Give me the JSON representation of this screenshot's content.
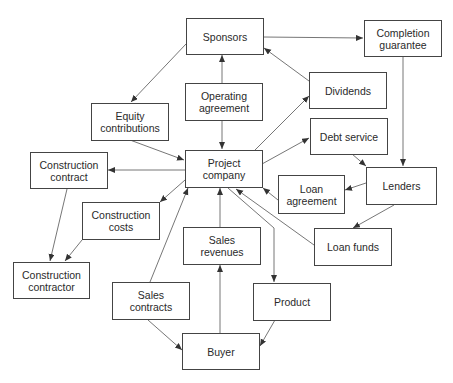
{
  "diagram": {
    "title": "",
    "colors": {
      "stroke": "#444444",
      "text": "#2a2a2a",
      "background": "#ffffff"
    },
    "nodes": {
      "sponsors": {
        "label": "Sponsors"
      },
      "completion_guarantee": {
        "label": "Completion\nguarantee"
      },
      "operating_agreement": {
        "label": "Operating\nagreement"
      },
      "dividends": {
        "label": "Dividends"
      },
      "equity_contributions": {
        "label": "Equity\ncontributions"
      },
      "debt_service": {
        "label": "Debt service"
      },
      "construction_contract": {
        "label": "Construction\ncontract"
      },
      "project_company": {
        "label": "Project\ncompany"
      },
      "lenders": {
        "label": "Lenders"
      },
      "loan_agreement": {
        "label": "Loan\nagreement"
      },
      "construction_costs": {
        "label": "Construction\ncosts"
      },
      "loan_funds": {
        "label": "Loan funds"
      },
      "sales_revenues": {
        "label": "Sales\nrevenues"
      },
      "construction_contractor": {
        "label": "Construction\ncontractor"
      },
      "sales_contracts": {
        "label": "Sales\ncontracts"
      },
      "product": {
        "label": "Product"
      },
      "buyer": {
        "label": "Buyer"
      }
    },
    "edges": [
      {
        "from": "Sponsors",
        "to": "Completion guarantee"
      },
      {
        "from": "Sponsors",
        "to": "Equity contributions"
      },
      {
        "from": "Operating agreement",
        "to": "Sponsors"
      },
      {
        "from": "Operating agreement",
        "to": "Project company"
      },
      {
        "from": "Dividends",
        "to": "Sponsors"
      },
      {
        "from": "Completion guarantee",
        "to": "Lenders"
      },
      {
        "from": "Equity contributions",
        "to": "Project company"
      },
      {
        "from": "Project company",
        "to": "Construction contract"
      },
      {
        "from": "Project company",
        "to": "Dividends"
      },
      {
        "from": "Project company",
        "to": "Debt service"
      },
      {
        "from": "Debt service",
        "to": "Lenders"
      },
      {
        "from": "Lenders",
        "to": "Loan agreement"
      },
      {
        "from": "Loan agreement",
        "to": "Project company"
      },
      {
        "from": "Lenders",
        "to": "Loan funds"
      },
      {
        "from": "Loan funds",
        "to": "Project company"
      },
      {
        "from": "Project company",
        "to": "Construction costs"
      },
      {
        "from": "Construction contract",
        "to": "Construction contractor"
      },
      {
        "from": "Construction costs",
        "to": "Construction contractor"
      },
      {
        "from": "Sales revenues",
        "to": "Project company"
      },
      {
        "from": "Sales contracts",
        "to": "Project company"
      },
      {
        "from": "Sales contracts",
        "to": "Buyer"
      },
      {
        "from": "Buyer",
        "to": "Sales revenues"
      },
      {
        "from": "Project company",
        "to": "Product"
      },
      {
        "from": "Product",
        "to": "Buyer"
      }
    ]
  }
}
